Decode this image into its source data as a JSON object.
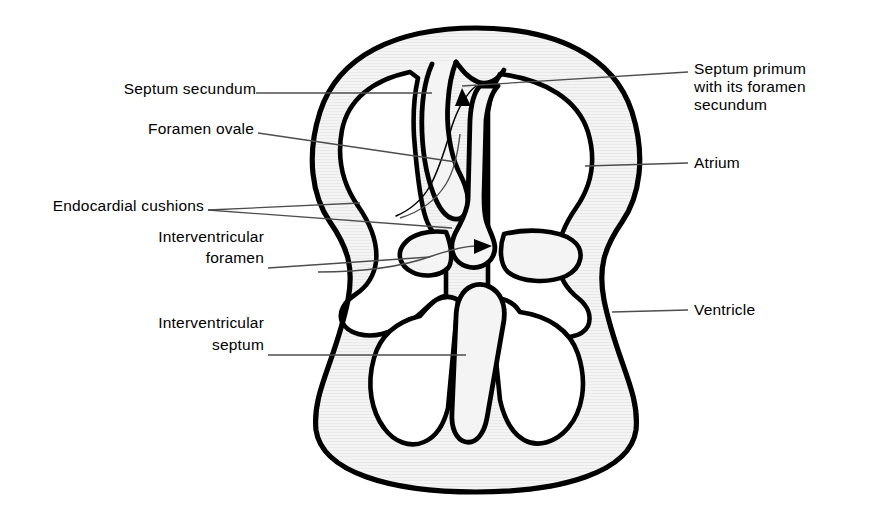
{
  "figure": {
    "colors": {
      "outline": "#000000",
      "wall_fill": "#f1f1f1",
      "chamber_fill": "#ffffff",
      "leader": "#4d4d4d",
      "text": "#000000",
      "background": "#ffffff"
    }
  },
  "labels": {
    "septum_secundum": "Septum secundum",
    "foramen_ovale": "Foramen ovale",
    "endocardial_cushions": "Endocardial cushions",
    "interventricular_foramen_line1": "Interventricular",
    "interventricular_foramen_line2": "foramen",
    "interventricular_septum_line1": "Interventricular",
    "interventricular_septum_line2": "septum",
    "septum_primum_line1": "Septum primum",
    "septum_primum_line2": "with its foramen",
    "septum_primum_line3": "secundum",
    "atrium": "Atrium",
    "ventricle": "Ventricle"
  },
  "annotations": {
    "arrow_atrial": "blood-flow-arrow-through-foramen-ovale",
    "arrow_ventricular": "blood-flow-arrow-through-interventricular-foramen"
  }
}
